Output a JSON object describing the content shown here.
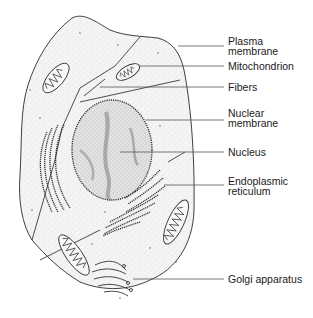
{
  "diagram": {
    "colors": {
      "line": "#2a2a2a",
      "cytoplasm": "#f2f2f2",
      "nucleus": "#d9d9d9",
      "label_text": "#1a1a1a"
    },
    "labels": [
      {
        "id": "plasma-membrane",
        "text": "Plasma\nmembrane",
        "top": 34
      },
      {
        "id": "mitochondrion",
        "text": "Mitochondrion",
        "top": 64
      },
      {
        "id": "fibers",
        "text": "Fibers",
        "top": 85
      },
      {
        "id": "nuclear-membrane",
        "text": "Nuclear\nmembrane",
        "top": 113
      },
      {
        "id": "nucleus",
        "text": "Nucleus",
        "top": 148
      },
      {
        "id": "endoplasmic-reticulum",
        "text": "Endoplasmic\nreticulum",
        "top": 177
      },
      {
        "id": "golgi-apparatus",
        "text": "Golgi apparatus",
        "top": 264
      }
    ]
  }
}
